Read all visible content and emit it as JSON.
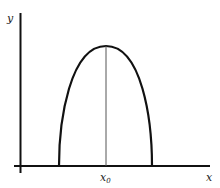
{
  "diagram": {
    "type": "curve-with-axes",
    "axes": {
      "x_label": "x",
      "y_label": "y"
    },
    "marker": {
      "label_base": "x",
      "label_sub": "0",
      "meaning": "x-coordinate of the curve maximum"
    },
    "colors": {
      "axis": "#111111",
      "curve": "#111111",
      "marker_line": "#555555",
      "background": "#ffffff"
    }
  }
}
